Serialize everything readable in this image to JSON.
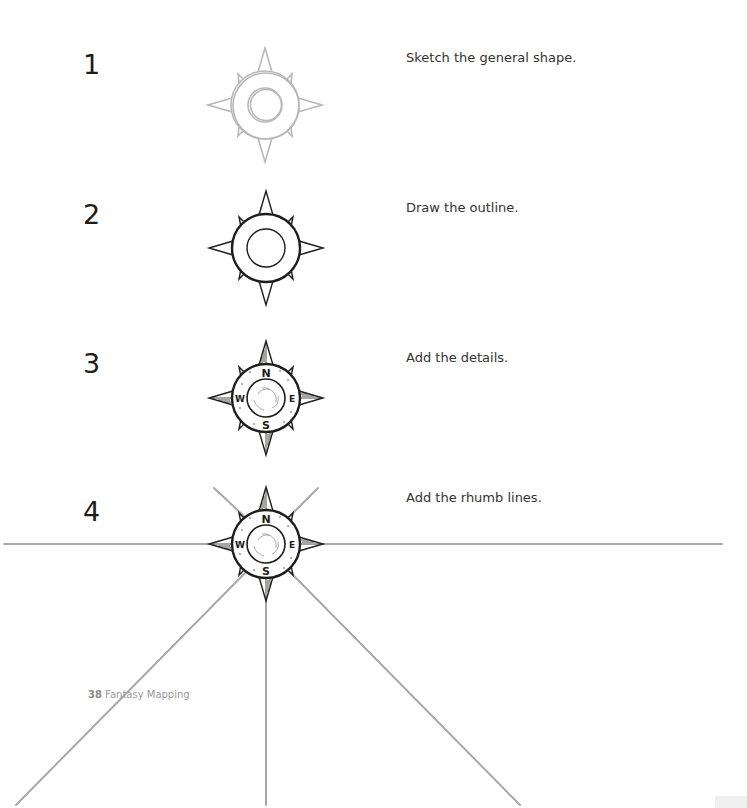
{
  "page": {
    "folio_number": "38",
    "folio_title": "Fantasy Mapping"
  },
  "steps": [
    {
      "number": "1",
      "text": "Sketch the general shape."
    },
    {
      "number": "2",
      "text": "Draw the outline."
    },
    {
      "number": "3",
      "text": "Add the details."
    },
    {
      "number": "4",
      "text": "Add the rhumb lines."
    }
  ],
  "compass": {
    "cardinal_labels": {
      "north": "N",
      "east": "E",
      "south": "S",
      "west": "W"
    }
  },
  "colors": {
    "ink": "#1d1d1b",
    "sketch": "#b8b8b8",
    "rhumb_line": "#a8a8a8",
    "folio": "#9a9a9a"
  }
}
